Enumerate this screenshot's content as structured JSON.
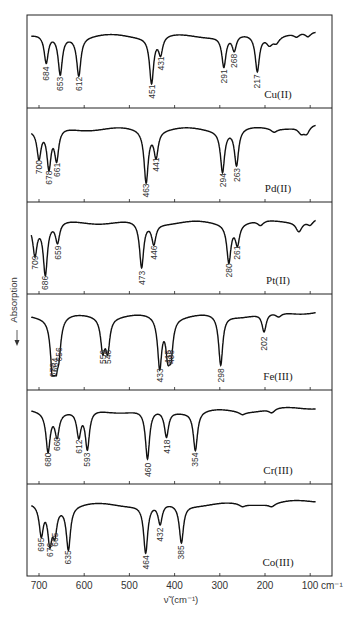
{
  "chart_data": {
    "type": "line",
    "title": "",
    "xlabel": "ν̃ (cm⁻¹)",
    "ylabel": "Absorption",
    "ylabel_arrow": "←",
    "xlim": [
      725,
      50
    ],
    "x_ticks": [
      700,
      600,
      500,
      400,
      300,
      200,
      100
    ],
    "x_tick_labels": [
      "700",
      "600",
      "500",
      "400",
      "300",
      "200",
      "100 cm⁻¹"
    ],
    "grid": false,
    "units": "cm⁻¹",
    "panels": [
      {
        "name": "Cu(II)",
        "peaks": [
          {
            "x": 684,
            "depth": 0.55,
            "label": "684"
          },
          {
            "x": 653,
            "depth": 0.75,
            "label": "653"
          },
          {
            "x": 612,
            "depth": 0.75,
            "label": "612"
          },
          {
            "x": 451,
            "depth": 0.9,
            "label": "451"
          },
          {
            "x": 431,
            "depth": 0.35,
            "label": "431"
          },
          {
            "x": 291,
            "depth": 0.6,
            "label": "291"
          },
          {
            "x": 268,
            "depth": 0.3,
            "label": "268"
          },
          {
            "x": 217,
            "depth": 0.7,
            "label": "217"
          },
          {
            "x": 190,
            "depth": 0.15,
            "label": ""
          },
          {
            "x": 175,
            "depth": 0.12,
            "label": ""
          },
          {
            "x": 130,
            "depth": 0.08,
            "label": ""
          },
          {
            "x": 105,
            "depth": 0.1,
            "label": ""
          }
        ]
      },
      {
        "name": "Pd(II)",
        "peaks": [
          {
            "x": 700,
            "depth": 0.55,
            "label": "700"
          },
          {
            "x": 678,
            "depth": 0.75,
            "label": "678"
          },
          {
            "x": 661,
            "depth": 0.6,
            "label": "661"
          },
          {
            "x": 463,
            "depth": 1.0,
            "label": "463"
          },
          {
            "x": 441,
            "depth": 0.5,
            "label": "441"
          },
          {
            "x": 294,
            "depth": 0.8,
            "label": "294"
          },
          {
            "x": 263,
            "depth": 0.7,
            "label": "263"
          },
          {
            "x": 180,
            "depth": 0.07,
            "label": ""
          },
          {
            "x": 120,
            "depth": 0.12,
            "label": ""
          },
          {
            "x": 108,
            "depth": 0.15,
            "label": ""
          }
        ]
      },
      {
        "name": "Pt(II)",
        "peaks": [
          {
            "x": 709,
            "depth": 0.6,
            "label": "709"
          },
          {
            "x": 686,
            "depth": 1.0,
            "label": "686"
          },
          {
            "x": 659,
            "depth": 0.4,
            "label": "659"
          },
          {
            "x": 473,
            "depth": 0.9,
            "label": "473"
          },
          {
            "x": 446,
            "depth": 0.4,
            "label": "446"
          },
          {
            "x": 280,
            "depth": 0.75,
            "label": "280"
          },
          {
            "x": 261,
            "depth": 0.4,
            "label": "261"
          },
          {
            "x": 210,
            "depth": 0.1,
            "label": ""
          },
          {
            "x": 125,
            "depth": 0.2,
            "label": ""
          },
          {
            "x": 100,
            "depth": 0.1,
            "label": ""
          }
        ]
      },
      {
        "name": "Fe(III)",
        "peaks": [
          {
            "x": 670,
            "depth": 0.85,
            "label": "670"
          },
          {
            "x": 664,
            "depth": 0.75,
            "label": "664"
          },
          {
            "x": 656,
            "depth": 0.55,
            "label": "656"
          },
          {
            "x": 559,
            "depth": 0.6,
            "label": "559"
          },
          {
            "x": 548,
            "depth": 0.6,
            "label": "548"
          },
          {
            "x": 433,
            "depth": 0.95,
            "label": "433"
          },
          {
            "x": 415,
            "depth": 0.6,
            "label": "415"
          },
          {
            "x": 408,
            "depth": 0.6,
            "label": "408"
          },
          {
            "x": 298,
            "depth": 0.95,
            "label": "298"
          },
          {
            "x": 202,
            "depth": 0.35,
            "label": "202"
          },
          {
            "x": 170,
            "depth": 0.08,
            "label": ""
          }
        ]
      },
      {
        "name": "Cr(III)",
        "peaks": [
          {
            "x": 680,
            "depth": 0.75,
            "label": "680"
          },
          {
            "x": 660,
            "depth": 0.45,
            "label": "660"
          },
          {
            "x": 612,
            "depth": 0.5,
            "label": "612"
          },
          {
            "x": 593,
            "depth": 0.75,
            "label": "593"
          },
          {
            "x": 460,
            "depth": 0.95,
            "label": "460"
          },
          {
            "x": 418,
            "depth": 0.5,
            "label": "418"
          },
          {
            "x": 354,
            "depth": 0.75,
            "label": "354"
          },
          {
            "x": 250,
            "depth": 0.05,
            "label": ""
          },
          {
            "x": 185,
            "depth": 0.08,
            "label": ""
          }
        ]
      },
      {
        "name": "Co(III)",
        "peaks": [
          {
            "x": 695,
            "depth": 0.6,
            "label": "695"
          },
          {
            "x": 676,
            "depth": 0.7,
            "label": "676"
          },
          {
            "x": 665,
            "depth": 0.5,
            "label": "665"
          },
          {
            "x": 635,
            "depth": 0.85,
            "label": "635"
          },
          {
            "x": 464,
            "depth": 0.95,
            "label": "464"
          },
          {
            "x": 432,
            "depth": 0.4,
            "label": "432"
          },
          {
            "x": 385,
            "depth": 0.75,
            "label": "385"
          },
          {
            "x": 250,
            "depth": 0.05,
            "label": ""
          },
          {
            "x": 185,
            "depth": 0.06,
            "label": ""
          }
        ]
      }
    ]
  }
}
